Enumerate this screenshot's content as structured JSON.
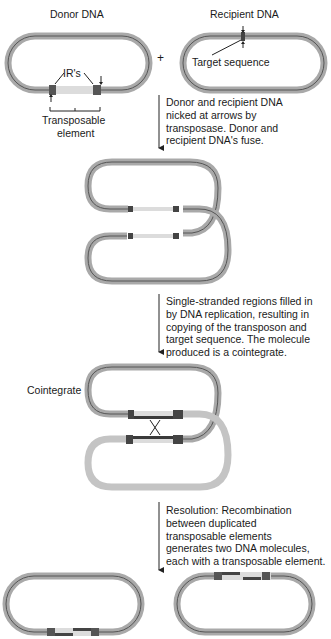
{
  "labels": {
    "donor": "Donor DNA",
    "recipient": "Recipient DNA",
    "plus": "+",
    "irs": "IR's",
    "target": "Target sequence",
    "transposable_1": "Transposable",
    "transposable_2": "element",
    "cointegrate": "Cointegrate"
  },
  "steps": [
    {
      "lines": [
        "Donor and recipient DNA",
        "nicked at arrows by",
        "transposase. Donor and",
        "recipient DNA's fuse."
      ]
    },
    {
      "lines": [
        "Single-stranded regions filled in",
        "by DNA replication, resulting in",
        "copying of the transposon and",
        "target sequence. The molecule",
        "produced is a cointegrate."
      ]
    },
    {
      "lines": [
        "Resolution: Recombination",
        "between duplicated",
        "transposable elements",
        "generates two DNA molecules,",
        "each with a transposable element."
      ]
    }
  ],
  "colors": {
    "dna_outer": "#a9a9a9",
    "dna_inner": "#555555",
    "transposon": "#dcdcdc",
    "ir_box": "#4a4a4a",
    "recipient_light": "#c4c4c4",
    "text": "#1a1a1a"
  }
}
